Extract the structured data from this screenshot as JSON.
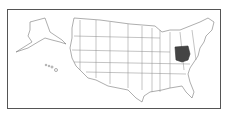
{
  "map": {
    "title": "Map of the United States",
    "highlighted_state": "Ohio",
    "colors": {
      "highlight": "#444444",
      "state_fill": "#ffffff",
      "border": "#777777",
      "frame": "#555555"
    },
    "insets": [
      "Alaska",
      "Hawaii"
    ]
  }
}
